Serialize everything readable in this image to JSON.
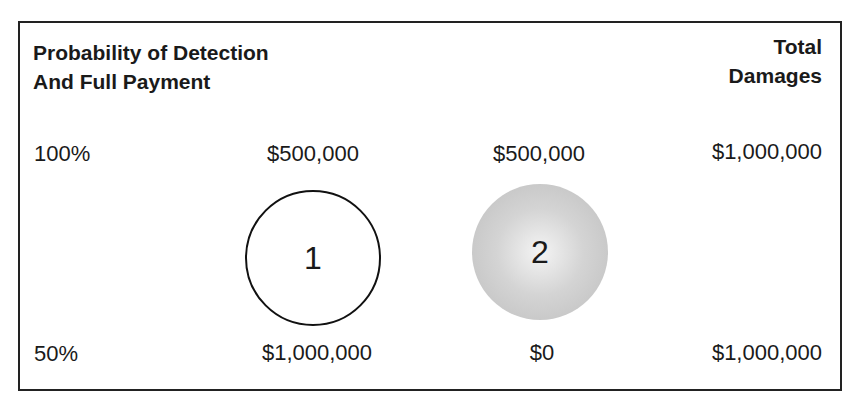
{
  "header": {
    "left_line1": "Probability of Detection",
    "left_line2": "And Full Payment",
    "right_line1": "Total",
    "right_line2": "Damages"
  },
  "rows": [
    {
      "probability": "100%",
      "option1": "$500,000",
      "option2": "$500,000",
      "total": "$1,000,000"
    },
    {
      "probability": "50%",
      "option1": "$1,000,000",
      "option2": "$0",
      "total": "$1,000,000"
    }
  ],
  "circles": [
    {
      "label": "1",
      "style": "outlined"
    },
    {
      "label": "2",
      "style": "gray-shaded"
    }
  ]
}
